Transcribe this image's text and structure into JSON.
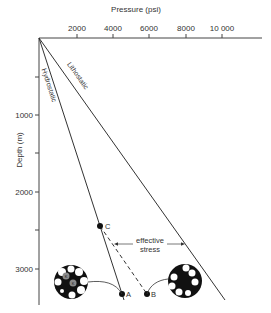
{
  "diagram": {
    "x_axis": {
      "label": "Pressure (psi)",
      "ticks": [
        {
          "value": 2000,
          "label": "2000"
        },
        {
          "value": 4000,
          "label": "4000"
        },
        {
          "value": 6000,
          "label": "6000"
        },
        {
          "value": 8000,
          "label": "8000"
        },
        {
          "value": 10000,
          "label": "10 000"
        }
      ]
    },
    "y_axis": {
      "label": "Depth (m)",
      "ticks": [
        {
          "value": 1000,
          "label": "1000"
        },
        {
          "value": 2000,
          "label": "2000"
        },
        {
          "value": 3000,
          "label": "3000"
        }
      ],
      "minor_ticks": [
        500,
        1500,
        2500
      ]
    },
    "lines": {
      "hydrostatic": {
        "label": "Hydrostatic",
        "color": "#333333"
      },
      "lithostatic": {
        "label": "Lithostatic",
        "color": "#333333"
      }
    },
    "points": {
      "A": {
        "label": "A"
      },
      "B": {
        "label": "B"
      },
      "C": {
        "label": "C"
      }
    },
    "annotation": {
      "line1": "effective",
      "line2": "stress"
    },
    "grain_labels": {
      "left_grain_1": "K",
      "left_grain_2": "K"
    },
    "colors": {
      "ink": "#222222",
      "text": "#333333",
      "grain_grey": "#8a8a8a",
      "background": "#ffffff"
    }
  }
}
